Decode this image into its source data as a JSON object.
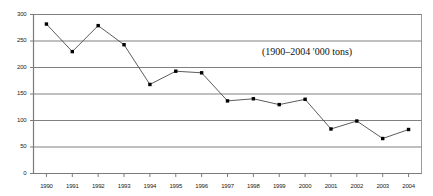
{
  "chart_data": {
    "type": "line",
    "title": "",
    "annotation": "(1900–2004 '000 tons)",
    "xlabel": "",
    "ylabel": "",
    "ylim": [
      0,
      300
    ],
    "ytick_labels": [
      "0",
      "50",
      "100",
      "150",
      "200",
      "250",
      "300"
    ],
    "ytick_values": [
      0,
      50,
      100,
      150,
      200,
      250,
      300
    ],
    "grid": true,
    "legend": "none",
    "categories": [
      "1990",
      "1991",
      "1992",
      "1993",
      "1994",
      "1995",
      "1996",
      "1997",
      "1998",
      "1999",
      "2000",
      "2001",
      "2002",
      "2003",
      "2004"
    ],
    "values": [
      282,
      230,
      279,
      243,
      168,
      193,
      190,
      137,
      141,
      130,
      140,
      84,
      99,
      66,
      83
    ],
    "series": [
      {
        "name": "production",
        "values": [
          282,
          230,
          279,
          243,
          168,
          193,
          190,
          137,
          141,
          130,
          140,
          84,
          99,
          66,
          83
        ]
      }
    ],
    "colors": {
      "line": "#4a4a4a",
      "marker": "#000000",
      "grid": "#808080",
      "axis": "#7a7a7a",
      "plot_border": "#9a9a9a",
      "background": "#ffffff"
    }
  }
}
